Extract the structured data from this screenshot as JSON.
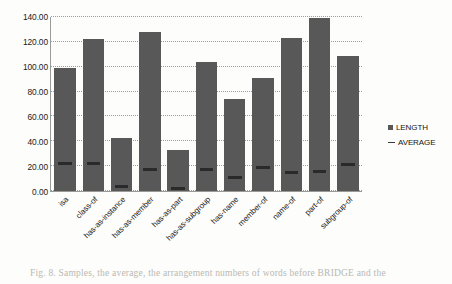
{
  "chart_data": {
    "type": "bar",
    "title": "",
    "xlabel": "",
    "ylabel": "",
    "ylim": [
      0,
      140
    ],
    "ytick_labels": [
      "0.00",
      "20.00",
      "40.00",
      "60.00",
      "80.00",
      "100.00",
      "120.00",
      "140.00"
    ],
    "ytick_values": [
      0,
      20,
      40,
      60,
      80,
      100,
      120,
      140
    ],
    "grid": "horizontal-dotted",
    "legend_position": "right",
    "categories": [
      "isa",
      "class-of",
      "has-as-instance",
      "has-as-member",
      "has-as-part",
      "has-as-subgroup",
      "has-name",
      "member-of",
      "name-of",
      "part-of",
      "subgroup-of"
    ],
    "series": [
      {
        "name": "LENGTH",
        "marker": "square",
        "color": "#585858",
        "values": [
          99,
          122,
          43,
          128,
          33,
          104,
          74,
          91,
          123,
          139,
          109
        ]
      },
      {
        "name": "AVERAGE",
        "marker": "line",
        "color": "#2a2a2a",
        "values": [
          22,
          22,
          4,
          17,
          2,
          17,
          11,
          19,
          15,
          16,
          21
        ]
      }
    ]
  },
  "legend": {
    "entries": [
      {
        "label": "LENGTH",
        "marker": "square"
      },
      {
        "label": "AVERAGE",
        "marker": "line"
      }
    ]
  },
  "caption": {
    "text": "Fig. 8. Samples, the average, the arrangement numbers of words before BRIDGE and the"
  }
}
